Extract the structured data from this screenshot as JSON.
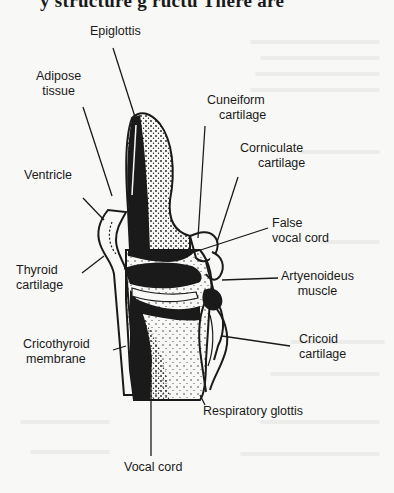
{
  "page": {
    "top_text_fragment": "y ... g ... ructu... There are"
  },
  "figure": {
    "labels": {
      "epiglottis": [
        "Epiglottis"
      ],
      "adipose_tissue": [
        "Adipose",
        "tissue"
      ],
      "cuneiform_cartilage": [
        "Cuneiform",
        "cartilage"
      ],
      "corniculate_cartilage": [
        "Corniculate",
        "cartilage"
      ],
      "ventricle": [
        "Ventricle"
      ],
      "false_vocal_cord": [
        "False",
        "vocal cord"
      ],
      "thyroid_cartilage": [
        "Thyroid",
        "cartilage"
      ],
      "artyenoideus_muscle": [
        "Artyenoideus",
        "muscle"
      ],
      "cricoid_cartilage": [
        "Cricoid",
        "cartilage"
      ],
      "cricothyroid_membrane": [
        "Cricothyroid",
        "membrane"
      ],
      "respiratory_glottis": [
        "Respiratory glottis"
      ],
      "vocal_cord": [
        "Vocal cord"
      ]
    },
    "colors": {
      "ink": "#1a1a1a",
      "paper": "#f8f8f6"
    }
  }
}
